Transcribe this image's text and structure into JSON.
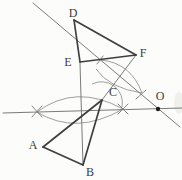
{
  "figure": {
    "canvas": {
      "width": 182,
      "height": 180,
      "background": "#fcfcfa"
    },
    "colors": {
      "thick_stroke": "#3f3f3f",
      "thin_stroke": "#6b6b6b",
      "arc_stroke": "#8f8f8f",
      "tick_stroke": "#777777",
      "label_color": "#3d3d3d",
      "dot_fill": "#1e1e1e",
      "smudge": "#e4e4df"
    },
    "stroke_widths": {
      "thick": 1.7,
      "thin": 0.9,
      "arc": 0.85,
      "tick": 0.9
    },
    "points": {
      "A": {
        "x": 43,
        "y": 147
      },
      "B": {
        "x": 83,
        "y": 165
      },
      "C": {
        "x": 102,
        "y": 100
      },
      "D": {
        "x": 74,
        "y": 20
      },
      "E": {
        "x": 80,
        "y": 62
      },
      "F": {
        "x": 136,
        "y": 55
      },
      "O": {
        "x": 158,
        "y": 109
      }
    },
    "labels": [
      {
        "id": "label-D",
        "text": "D",
        "x": 73,
        "y": 17,
        "size": 12
      },
      {
        "id": "label-E",
        "text": "E",
        "x": 68,
        "y": 66,
        "size": 12
      },
      {
        "id": "label-F",
        "text": "F",
        "x": 143,
        "y": 57,
        "size": 12
      },
      {
        "id": "label-C",
        "text": "C",
        "x": 113,
        "y": 96,
        "size": 12
      },
      {
        "id": "label-O",
        "text": "O",
        "x": 160,
        "y": 100,
        "size": 12
      },
      {
        "id": "label-A",
        "text": "A",
        "x": 33,
        "y": 149,
        "size": 12
      },
      {
        "id": "label-B",
        "text": "B",
        "x": 90,
        "y": 176,
        "size": 12
      }
    ],
    "thin_lines": [
      {
        "id": "construction-line-horizontal",
        "x1": 3,
        "y1": 113,
        "x2": 182,
        "y2": 108
      },
      {
        "id": "construction-line-diagonal-through-O",
        "x1": 33,
        "y1": 3,
        "x2": 180,
        "y2": 127
      },
      {
        "id": "segment-E-B",
        "x1": 80,
        "y1": 63,
        "x2": 83,
        "y2": 165
      },
      {
        "id": "segment-F-C",
        "x1": 136,
        "y1": 55,
        "x2": 102,
        "y2": 100
      }
    ],
    "thick_lines": [
      {
        "id": "edge-A-B",
        "x1": 43,
        "y1": 147,
        "x2": 83,
        "y2": 165
      },
      {
        "id": "edge-B-C",
        "x1": 83,
        "y1": 165,
        "x2": 102,
        "y2": 100
      },
      {
        "id": "edge-C-A",
        "x1": 102,
        "y1": 100,
        "x2": 43,
        "y2": 147
      },
      {
        "id": "edge-D-E",
        "x1": 74,
        "y1": 20,
        "x2": 80,
        "y2": 62
      },
      {
        "id": "edge-E-F",
        "x1": 80,
        "y1": 62,
        "x2": 136,
        "y2": 55
      },
      {
        "id": "edge-F-D",
        "x1": 136,
        "y1": 55,
        "x2": 74,
        "y2": 20
      }
    ],
    "arcs": [
      {
        "id": "compass-arc-lower-lens-upper",
        "d": "M 37 112 Q 76 83 123 109"
      },
      {
        "id": "compass-arc-lower-lens-lower",
        "d": "M 37 112 Q 76 136 123 109"
      },
      {
        "id": "compass-arc-upper-lens-upper",
        "d": "M 101 60 Q 131 63 142 93"
      },
      {
        "id": "compass-arc-upper-lens-lower",
        "d": "M 96 69 Q 109 88 142 93"
      },
      {
        "id": "compass-arc-angle-at-C",
        "d": "M 92 84 A 21 21 0 0 1 122 107"
      }
    ],
    "ticks": [
      {
        "id": "tick-left-cross-a",
        "x1": 32,
        "y1": 106,
        "x2": 42,
        "y2": 117
      },
      {
        "id": "tick-left-cross-b",
        "x1": 32,
        "y1": 117,
        "x2": 42,
        "y2": 106
      },
      {
        "id": "tick-right-cross-a",
        "x1": 118,
        "y1": 104,
        "x2": 128,
        "y2": 114
      },
      {
        "id": "tick-right-cross-b",
        "x1": 118,
        "y1": 114,
        "x2": 128,
        "y2": 104
      },
      {
        "id": "tick-on-diagonal-lower",
        "x1": 136,
        "y1": 99,
        "x2": 146,
        "y2": 90
      },
      {
        "id": "tick-on-diagonal-upper",
        "x1": 97,
        "y1": 64,
        "x2": 103,
        "y2": 56
      }
    ],
    "point_dot": {
      "id": "point-O-dot",
      "x": 158,
      "y": 109,
      "r": 2.2
    },
    "smudges": [
      {
        "id": "scan-smudge-right-edge",
        "cx": 179,
        "cy": 103,
        "rx": 5,
        "ry": 11,
        "opacity": 0.55
      }
    ]
  }
}
